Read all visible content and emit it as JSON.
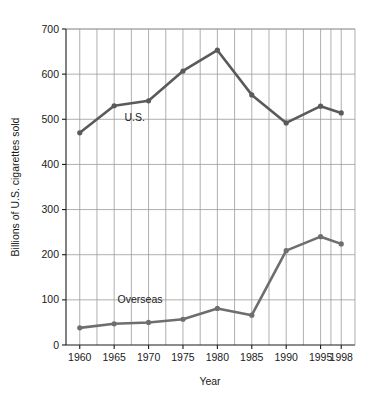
{
  "chart_data": {
    "type": "line",
    "title": "",
    "xlabel": "Year",
    "ylabel": "Billions of U.S. cigarettes sold",
    "x": [
      1960,
      1965,
      1970,
      1975,
      1980,
      1985,
      1990,
      1995,
      1998
    ],
    "categories": [
      "1960",
      "1965",
      "1970",
      "1975",
      "1980",
      "1985",
      "1990",
      "1995",
      "1998"
    ],
    "xlim": [
      1958,
      2000
    ],
    "ylim": [
      0,
      700
    ],
    "xticks": [
      "1960",
      "1965",
      "1970",
      "1975",
      "1980",
      "1985",
      "1990",
      "1995",
      "1998"
    ],
    "yticks": [
      "0",
      "100",
      "200",
      "300",
      "400",
      "500",
      "600",
      "700"
    ],
    "grid": "both",
    "legend_position": "inline-annotation",
    "series": [
      {
        "name": "U.S.",
        "label": "U.S.",
        "color": "#5a5a5a",
        "values": [
          470,
          530,
          541,
          607,
          653,
          554,
          492,
          529,
          514
        ]
      },
      {
        "name": "Overseas",
        "label": "Overseas",
        "color": "#6e6e6e",
        "values": [
          38,
          47,
          50,
          57,
          81,
          66,
          209,
          240,
          224
        ]
      }
    ],
    "annotations": [
      {
        "text": "U.S.",
        "x": 1966.5,
        "y": 497
      },
      {
        "text": "Overseas",
        "x": 1965.5,
        "y": 92
      }
    ]
  },
  "colors": {
    "axis": "#1a1a1a",
    "grid": "#9a9a9a",
    "us_line": "#5a5a5a",
    "overseas_line": "#6e6e6e",
    "background": "#ffffff"
  },
  "axes": {
    "y_title": "Billions of U.S. cigarettes sold",
    "x_title": "Year",
    "y_ticks": [
      {
        "label": "700"
      },
      {
        "label": "600"
      },
      {
        "label": "500"
      },
      {
        "label": "400"
      },
      {
        "label": "300"
      },
      {
        "label": "200"
      },
      {
        "label": "100"
      },
      {
        "label": "0"
      }
    ],
    "x_ticks": [
      {
        "label": "1960"
      },
      {
        "label": "1965"
      },
      {
        "label": "1970"
      },
      {
        "label": "1975"
      },
      {
        "label": "1980"
      },
      {
        "label": "1985"
      },
      {
        "label": "1990"
      },
      {
        "label": "1995"
      },
      {
        "label": "1998"
      }
    ]
  },
  "labels": {
    "us_annotation": "U.S.",
    "overseas_annotation": "Overseas"
  }
}
